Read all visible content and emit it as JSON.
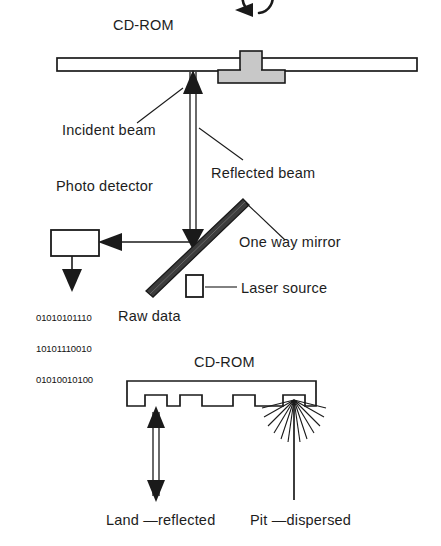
{
  "figure": {
    "top_section": {
      "disc_title": "CD-ROM",
      "rotation_icon": "rotation-arrow-icon",
      "labels": {
        "incident_beam": "Incident beam",
        "reflected_beam": "Reflected beam",
        "photo_detector": "Photo detector",
        "one_way_mirror": "One way mirror",
        "laser_source": "Laser source",
        "raw_data": "Raw data"
      },
      "raw_data_bits": [
        "01010101110",
        "10101110010",
        "01010010100"
      ]
    },
    "bottom_section": {
      "disc_title": "CD-ROM",
      "labels": {
        "land": "Land —reflected",
        "pit": "Pit —dispersed"
      }
    },
    "colors": {
      "stroke": "#1a1a1a",
      "disc_fill": "#ffffff",
      "spindle_fill": "#c8c8c8",
      "mirror_fill": "#3c3c3c",
      "background": "#ffffff",
      "text": "#1d1d1d"
    }
  }
}
